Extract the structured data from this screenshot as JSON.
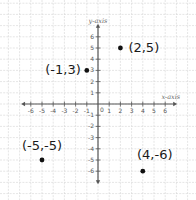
{
  "chart_data": {
    "type": "scatter",
    "title": "",
    "xlabel": "x-axis",
    "ylabel": "y-axis",
    "xlim": [
      -6,
      6
    ],
    "ylim": [
      -6,
      6
    ],
    "grid": true,
    "x_ticks": [
      -6,
      -5,
      -4,
      -3,
      -2,
      -1,
      1,
      2,
      3,
      4,
      5,
      6
    ],
    "y_ticks": [
      6,
      5,
      4,
      3,
      2,
      1,
      -1,
      -2,
      -3,
      -4,
      -5,
      -6
    ],
    "origin_label": "0",
    "points": [
      {
        "x": 2,
        "y": 5,
        "label": "(2,5)"
      },
      {
        "x": -1,
        "y": 3,
        "label": "(-1,3)"
      },
      {
        "x": -5,
        "y": -5,
        "label": "(-5,-5)"
      },
      {
        "x": 4,
        "y": -6,
        "label": "(4,-6)"
      }
    ]
  },
  "colors": {
    "grid": "#d4d4d4",
    "axis": "#555555",
    "point": "#111111",
    "label": "#1a1a1a"
  }
}
